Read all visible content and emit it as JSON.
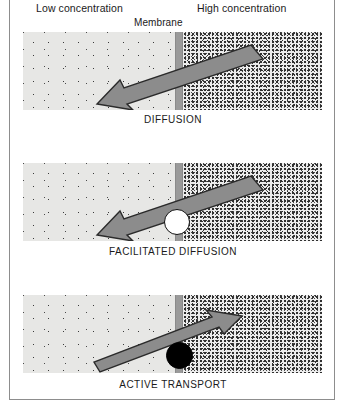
{
  "figure": {
    "title_labels": {
      "low": "Low concentration",
      "high": "High concentration",
      "membrane": "Membrane"
    },
    "frame_color": "#8d8d8d",
    "background": "#ffffff"
  },
  "colors": {
    "low_field": "#e7e7e5",
    "high_field": "#ececec",
    "membrane": "#9a9a9a",
    "arrow_fill": "#8c8c8c",
    "arrow_stroke": "#2b2b2b",
    "carrier_white": "#ffffff",
    "carrier_black": "#000000",
    "text": "#1a1a1a"
  },
  "panels": [
    {
      "id": "diffusion",
      "caption": "DIFFUSION",
      "direction": "high-to-low",
      "arrow_label": "arrow pointing left and downward from high concentration into low concentration",
      "carrier": "none"
    },
    {
      "id": "facilitated-diffusion",
      "caption": "FACILITATED DIFFUSION",
      "direction": "high-to-low",
      "arrow_label": "arrow pointing left and downward from high concentration into low concentration",
      "carrier": "white-circle"
    },
    {
      "id": "active-transport",
      "caption": "ACTIVE TRANSPORT",
      "direction": "low-to-high",
      "arrow_label": "arrow pointing right and upward from low concentration into high concentration",
      "carrier": "black-circle"
    }
  ]
}
